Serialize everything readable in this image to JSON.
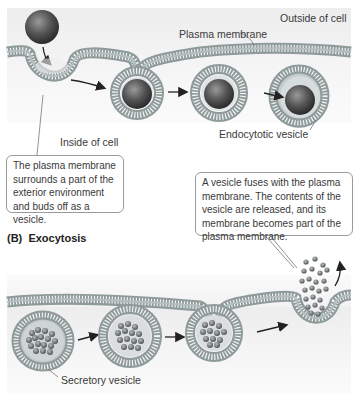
{
  "endocytosis": {
    "labels": {
      "outside": "Outside of cell",
      "membrane": "Plasma membrane",
      "inside": "Inside of cell",
      "vesicle": "Endocytotic vesicle"
    },
    "callout": "The plasma membrane surrounds a part of the exterior environment and buds off as a vesicle."
  },
  "exocytosis": {
    "title_prefix": "(B)",
    "title": "Exocytosis",
    "labels": {
      "vesicle": "Secretory vesicle"
    },
    "callout": "A vesicle fuses with the plasma membrane. The contents of the vesicle are released, and its membrane becomes part of the plasma membrane."
  },
  "colors": {
    "membrane": "#a8b3b3",
    "membrane_stripe": "#ffffff",
    "particle": "#5a5e62",
    "cargo": "#6f7478",
    "arrow": "#222222"
  }
}
